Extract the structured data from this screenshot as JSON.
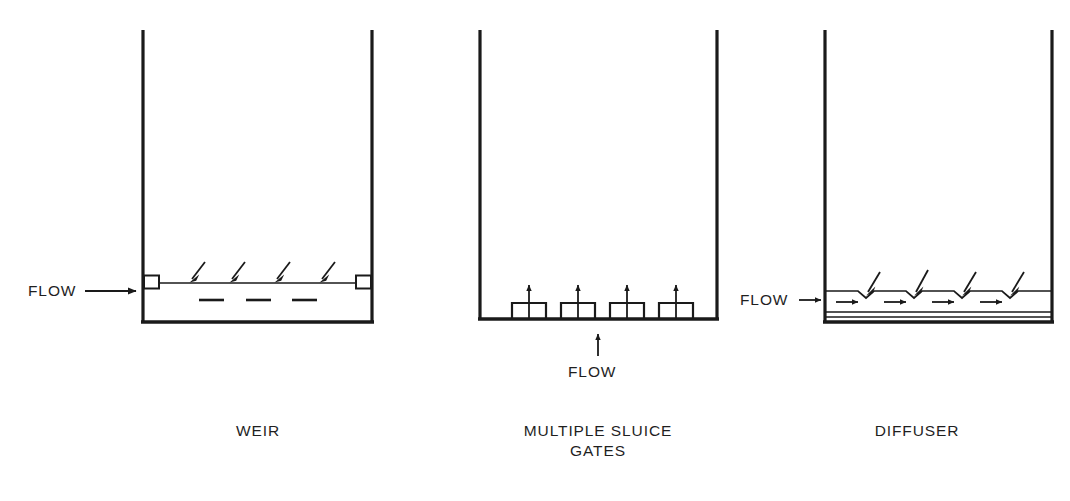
{
  "figure": {
    "title": "",
    "background_color": "#ffffff",
    "ink_color": "#1a1a1a",
    "panel_count": 3
  },
  "panels": [
    {
      "id": "weir",
      "caption": "WEIR",
      "caption_lines": [
        "WEIR"
      ],
      "flow_label": "FLOW",
      "flow_direction": "right",
      "flow_entry": "left-wall-at-water-surface",
      "tank": {
        "left_x": 143,
        "right_x": 372,
        "top_y": 30,
        "floor_y": 322,
        "water_surface_y": 283,
        "open_top": true
      },
      "weir_plates": 2,
      "surface_arrows": 4,
      "surface_arrow_direction": "down-left",
      "submerged_dashes": 3
    },
    {
      "id": "multiple-sluice-gates",
      "caption": "MULTIPLE SLUICE GATES",
      "caption_lines": [
        "MULTIPLE SLUICE",
        "GATES"
      ],
      "flow_label": "FLOW",
      "flow_direction": "up",
      "flow_entry": "below-floor-center",
      "tank": {
        "left_x": 480,
        "right_x": 717,
        "top_y": 30,
        "floor_y": 319,
        "open_top": true
      },
      "gate_count": 4,
      "gate_arrow_direction": "up"
    },
    {
      "id": "diffuser",
      "caption": "DIFFUSER",
      "caption_lines": [
        "DIFFUSER"
      ],
      "flow_label": "FLOW",
      "flow_direction": "right",
      "flow_entry": "left-wall-at-diffuser-channel",
      "tank": {
        "left_x": 825,
        "right_x": 1052,
        "top_y": 30,
        "floor_y": 322,
        "channel_top_y": 291,
        "channel_bottom_y": 312,
        "open_top": true
      },
      "notch_count": 4,
      "notch_arrow_direction": "down-left",
      "internal_arrows": 4,
      "internal_arrow_direction": "right"
    }
  ],
  "labels": {
    "weir_caption": "WEIR",
    "sluice_caption_line1": "MULTIPLE SLUICE",
    "sluice_caption_line2": "GATES",
    "diffuser_caption": "DIFFUSER",
    "flow_weir": "FLOW",
    "flow_sluice": "FLOW",
    "flow_diffuser": "FLOW"
  },
  "colors": {
    "ink": "#1a1a1a",
    "paper": "#ffffff"
  }
}
